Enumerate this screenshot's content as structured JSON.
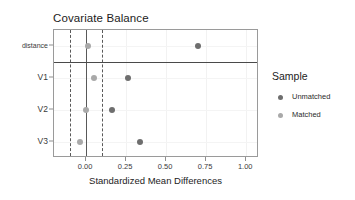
{
  "chart_data": {
    "type": "scatter",
    "title": "Covariate Balance",
    "xlabel": "Standardized Mean Differences",
    "ylabel": "",
    "categories": [
      "distance",
      "V1",
      "V2",
      "V3"
    ],
    "xticks": [
      "0.00",
      "0.25",
      "0.50",
      "0.75",
      "1.00"
    ],
    "xtick_values": [
      0.0,
      0.25,
      0.5,
      0.75,
      1.0
    ],
    "xlim": [
      -0.2,
      1.08
    ],
    "grid": true,
    "legend_position": "right",
    "reference_lines": {
      "solid": [
        0.0
      ],
      "dashed": [
        -0.1,
        0.1
      ]
    },
    "row_separator_after": "distance",
    "series": [
      {
        "name": "Unmatched",
        "color": "#6e6e6e",
        "points": [
          {
            "category": "distance",
            "value": 0.7
          },
          {
            "category": "V1",
            "value": 0.26
          },
          {
            "category": "V2",
            "value": 0.16
          },
          {
            "category": "V3",
            "value": 0.34
          }
        ]
      },
      {
        "name": "Matched",
        "color": "#a9a9a9",
        "points": [
          {
            "category": "distance",
            "value": 0.01
          },
          {
            "category": "V1",
            "value": 0.05
          },
          {
            "category": "V2",
            "value": 0.0
          },
          {
            "category": "V3",
            "value": -0.04
          }
        ]
      }
    ]
  },
  "legend": {
    "title": "Sample",
    "items": [
      {
        "label": "Unmatched",
        "color": "#6e6e6e"
      },
      {
        "label": "Matched",
        "color": "#a9a9a9"
      }
    ]
  },
  "axes": {
    "y_labels": [
      "distance",
      "V1",
      "V2",
      "V3"
    ],
    "x_labels": [
      "0.00",
      "0.25",
      "0.50",
      "0.75",
      "1.00"
    ]
  }
}
